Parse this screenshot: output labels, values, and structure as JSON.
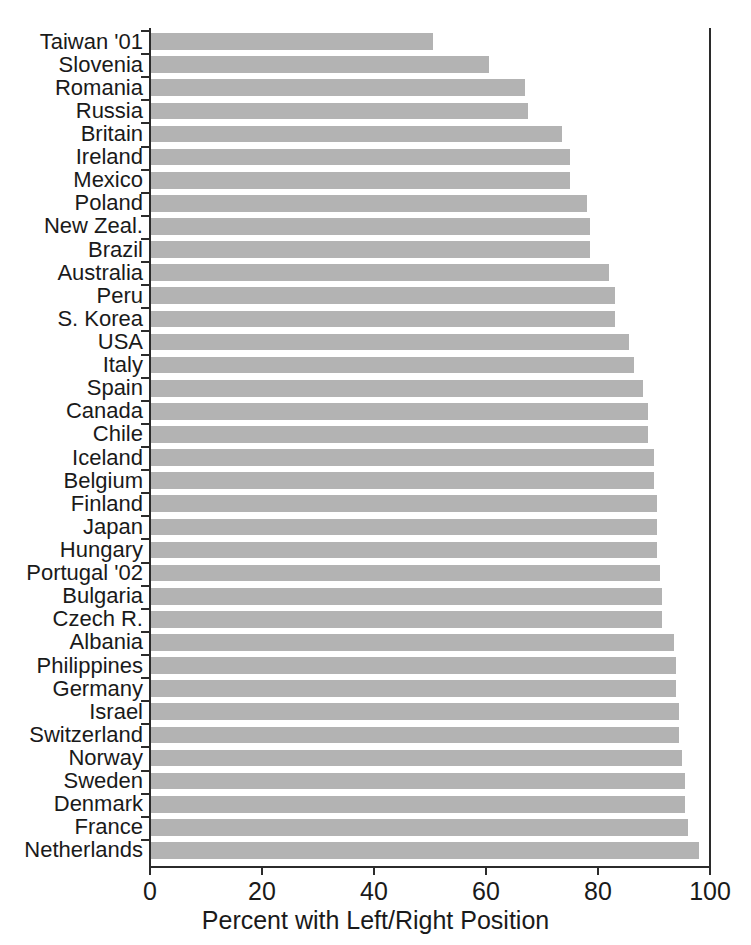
{
  "chart_data": {
    "type": "bar",
    "orientation": "horizontal",
    "title": "",
    "xlabel": "Percent with Left/Right Position",
    "ylabel": "",
    "xlim": [
      0,
      100
    ],
    "xticks": [
      0,
      20,
      40,
      60,
      80,
      100
    ],
    "xtick_labels": [
      "0",
      "20",
      "40",
      "60",
      "80",
      "100"
    ],
    "grid": false,
    "legend": null,
    "bar_color": "#b3b3b3",
    "axis_color": "#2b2b2b",
    "categories": [
      "Taiwan '01",
      "Slovenia",
      "Romania",
      "Russia",
      "Britain",
      "Ireland",
      "Mexico",
      "Poland",
      "New Zeal.",
      "Brazil",
      "Australia",
      "Peru",
      "S. Korea",
      "USA",
      "Italy",
      "Spain",
      "Canada",
      "Chile",
      "Iceland",
      "Belgium",
      "Finland",
      "Japan",
      "Hungary",
      "Portugal '02",
      "Bulgaria",
      "Czech R.",
      "Albania",
      "Philippines",
      "Germany",
      "Israel",
      "Switzerland",
      "Norway",
      "Sweden",
      "Denmark",
      "France",
      "Netherlands"
    ],
    "values": [
      50.5,
      60.5,
      67.0,
      67.5,
      73.5,
      75.0,
      75.0,
      78.0,
      78.5,
      78.5,
      82.0,
      83.0,
      83.0,
      85.5,
      86.5,
      88.0,
      89.0,
      89.0,
      90.0,
      90.0,
      90.5,
      90.5,
      90.5,
      91.0,
      91.5,
      91.5,
      93.5,
      94.0,
      94.0,
      94.5,
      94.5,
      95.0,
      95.5,
      95.5,
      96.0,
      98.0
    ]
  }
}
